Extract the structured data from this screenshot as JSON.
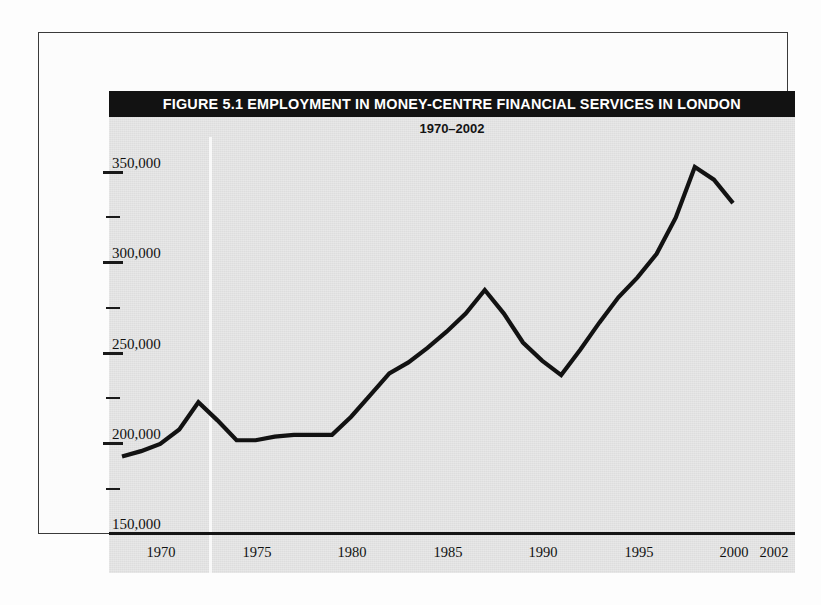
{
  "figure": {
    "title": "FIGURE 5.1  EMPLOYMENT IN MONEY-CENTRE FINANCIAL SERVICES IN LONDON",
    "subtitle": "1970–2002",
    "title_bar_color": "#121212",
    "panel_color": "#dddddd",
    "line_color": "#121212"
  },
  "chart_data": {
    "type": "line",
    "title": "FIGURE 5.1  EMPLOYMENT IN MONEY-CENTRE FINANCIAL SERVICES IN LONDON",
    "subtitle": "1970–2002",
    "xlabel": "",
    "ylabel": "",
    "grid": false,
    "legend": "none",
    "xlim": [
      1970,
      2002
    ],
    "ylim": [
      150000,
      350000
    ],
    "y_tick_labels": [
      "350,000",
      "300,000",
      "250,000",
      "200,000",
      "150,000"
    ],
    "y_ticks_major": [
      350000,
      300000,
      250000,
      200000,
      150000
    ],
    "y_ticks_minor": [
      325000,
      275000,
      225000,
      175000
    ],
    "x_tick_labels": [
      "1970",
      "1975",
      "1980",
      "1985",
      "1990",
      "1995",
      "2000",
      "2002"
    ],
    "x_ticks": [
      1970,
      1975,
      1980,
      1985,
      1990,
      1995,
      2000,
      2002
    ],
    "series": [
      {
        "name": "Employment in money-centre financial services in London",
        "x": [
          1970,
          1971,
          1972,
          1973,
          1974,
          1975,
          1976,
          1977,
          1978,
          1979,
          1980,
          1981,
          1982,
          1983,
          1984,
          1985,
          1986,
          1987,
          1988,
          1989,
          1990,
          1991,
          1992,
          1993,
          1994,
          1995,
          1996,
          1997,
          1998,
          1999,
          2000,
          2001,
          2002
        ],
        "values": [
          174000,
          177000,
          181000,
          189000,
          204000,
          194000,
          183000,
          183000,
          185000,
          186000,
          186000,
          186000,
          196000,
          208000,
          220000,
          226000,
          234000,
          243000,
          253000,
          266000,
          253000,
          237000,
          227000,
          219000,
          233000,
          248000,
          262000,
          273000,
          286000,
          306000,
          334000,
          327000,
          314000
        ]
      }
    ]
  }
}
